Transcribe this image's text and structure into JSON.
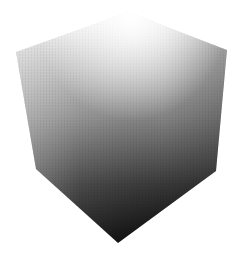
{
  "image": {
    "subject": "shaded cube",
    "description": "A 3D cube rendered in grayscale with a smooth gradient from white at the top corner to near-black at the bottom corner",
    "background_color": "#ffffff",
    "shading": {
      "highlight_color": "#ffffff",
      "midtone_color": "#8a8a8a",
      "left_edge_color": "#b0b0b0",
      "shadow_color": "#111111"
    }
  }
}
